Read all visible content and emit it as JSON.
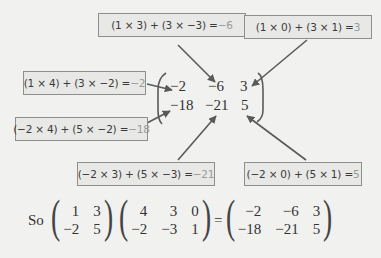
{
  "boxes": [
    {
      "id": "r1c2",
      "expr": "(1 × 3) + (3 × −3) = ",
      "result": "−6"
    },
    {
      "id": "r1c3",
      "expr": "(1 × 0) + (3 × 1) = ",
      "result": "3"
    },
    {
      "id": "r1c1",
      "expr": "(1 × 4) + (3 × −2) = ",
      "result": "−2"
    },
    {
      "id": "r2c1",
      "expr": "(−2 × 4) + (5 × −2) = ",
      "result": "−18"
    },
    {
      "id": "r2c2",
      "expr": "(−2 × 3) + (5 × −3) = ",
      "result": "−21"
    },
    {
      "id": "r2c3",
      "expr": "(−2 × 0) + (5 × 1) = ",
      "result": "5"
    }
  ],
  "result_matrix": [
    [
      "−2",
      "−6",
      "3"
    ],
    [
      "−18",
      "−21",
      "5"
    ]
  ],
  "equation": {
    "prefix": "So",
    "A": [
      [
        "1",
        "3"
      ],
      [
        "−2",
        "5"
      ]
    ],
    "B": [
      [
        "4",
        "3",
        "0"
      ],
      [
        "−2",
        "−3",
        "1"
      ]
    ],
    "equals": "=",
    "C": [
      [
        "−2",
        "−6",
        "3"
      ],
      [
        "−18",
        "−21",
        "5"
      ]
    ]
  },
  "colors": {
    "result_text": "#9a9a9a",
    "box_bg": "#e8e8e6",
    "box_border": "#8e8e8e",
    "arrow": "#5a5a5a"
  }
}
